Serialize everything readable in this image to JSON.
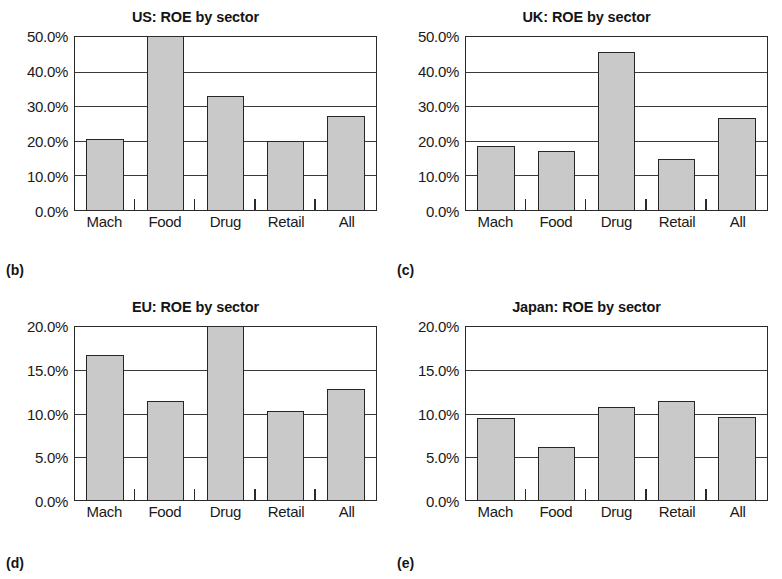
{
  "figure": {
    "background_color": "#ffffff",
    "bar_fill_color": "#c9c9c9",
    "bar_border_color": "#262626",
    "axis_color": "#2b2b2b",
    "text_color": "#1a1a1a"
  },
  "panels": [
    {
      "tag": "(b)",
      "title": "US: ROE by sector",
      "y_ticks": [
        "50.0%",
        "40.0%",
        "30.0%",
        "20.0%",
        "10.0%",
        "0.0%"
      ],
      "x_ticks": [
        "Mach",
        "Food",
        "Drug",
        "Retail",
        "All"
      ]
    },
    {
      "tag": "(c)",
      "title": "UK: ROE by sector",
      "y_ticks": [
        "50.0%",
        "40.0%",
        "30.0%",
        "20.0%",
        "10.0%",
        "0.0%"
      ],
      "x_ticks": [
        "Mach",
        "Food",
        "Drug",
        "Retail",
        "All"
      ]
    },
    {
      "tag": "(d)",
      "title": "EU: ROE by sector",
      "y_ticks": [
        "20.0%",
        "15.0%",
        "10.0%",
        "5.0%",
        "0.0%"
      ],
      "x_ticks": [
        "Mach",
        "Food",
        "Drug",
        "Retail",
        "All"
      ]
    },
    {
      "tag": "(e)",
      "title": "Japan: ROE by sector",
      "y_ticks": [
        "20.0%",
        "15.0%",
        "10.0%",
        "5.0%",
        "0.0%"
      ],
      "x_ticks": [
        "Mach",
        "Food",
        "Drug",
        "Retail",
        "All"
      ]
    }
  ],
  "chart_data": [
    {
      "type": "bar",
      "title": "US: ROE by sector",
      "panel": "(b)",
      "categories": [
        "Mach",
        "Food",
        "Drug",
        "Retail",
        "All"
      ],
      "values": [
        20.5,
        50.2,
        33.0,
        20.0,
        27.2
      ],
      "unit": "percent",
      "xlabel": "",
      "ylabel": "",
      "ylim": [
        0,
        50
      ],
      "ytick_values": [
        0,
        10,
        20,
        30,
        40,
        50
      ],
      "ytick_labels": [
        "0.0%",
        "10.0%",
        "20.0%",
        "30.0%",
        "40.0%",
        "50.0%"
      ],
      "grid": true,
      "legend": false
    },
    {
      "type": "bar",
      "title": "UK: ROE by sector",
      "panel": "(c)",
      "categories": [
        "Mach",
        "Food",
        "Drug",
        "Retail",
        "All"
      ],
      "values": [
        18.5,
        17.2,
        45.8,
        14.7,
        26.5
      ],
      "unit": "percent",
      "xlabel": "",
      "ylabel": "",
      "ylim": [
        0,
        50
      ],
      "ytick_values": [
        0,
        10,
        20,
        30,
        40,
        50
      ],
      "ytick_labels": [
        "0.0%",
        "10.0%",
        "20.0%",
        "30.0%",
        "40.0%",
        "50.0%"
      ],
      "grid": true,
      "legend": false
    },
    {
      "type": "bar",
      "title": "EU: ROE by sector",
      "panel": "(d)",
      "categories": [
        "Mach",
        "Food",
        "Drug",
        "Retail",
        "All"
      ],
      "values": [
        16.8,
        11.4,
        20.4,
        10.3,
        12.8
      ],
      "unit": "percent",
      "xlabel": "",
      "ylabel": "",
      "ylim": [
        0,
        20
      ],
      "ytick_values": [
        0,
        5,
        10,
        15,
        20
      ],
      "ytick_labels": [
        "0.0%",
        "5.0%",
        "10.0%",
        "15.0%",
        "20.0%"
      ],
      "grid": true,
      "legend": false
    },
    {
      "type": "bar",
      "title": "Japan: ROE by sector",
      "panel": "(e)",
      "categories": [
        "Mach",
        "Food",
        "Drug",
        "Retail",
        "All"
      ],
      "values": [
        9.5,
        6.1,
        10.7,
        11.5,
        9.6
      ],
      "unit": "percent",
      "xlabel": "",
      "ylabel": "",
      "ylim": [
        0,
        20
      ],
      "ytick_values": [
        0,
        5,
        10,
        15,
        20
      ],
      "ytick_labels": [
        "0.0%",
        "5.0%",
        "10.0%",
        "15.0%",
        "20.0%"
      ],
      "grid": true,
      "legend": false
    }
  ]
}
